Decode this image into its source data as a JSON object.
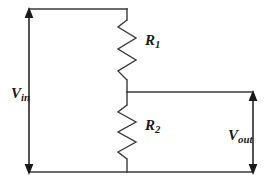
{
  "diagram": {
    "type": "schematic",
    "stroke_color": "#3a3a3a",
    "arrow_color": "#1a1a1a",
    "background_color": "#ffffff",
    "labels": {
      "vin": {
        "symbol": "V",
        "subscript": "in"
      },
      "vout": {
        "symbol": "V",
        "subscript": "out"
      },
      "r1": {
        "symbol": "R",
        "subscript": "1"
      },
      "r2": {
        "symbol": "R",
        "subscript": "2"
      }
    },
    "components": [
      {
        "name": "resistor-r1",
        "label": "R1"
      },
      {
        "name": "resistor-r2",
        "label": "R2"
      },
      {
        "name": "input-voltage-arrow",
        "label": "Vin"
      },
      {
        "name": "output-voltage-arrow",
        "label": "Vout"
      }
    ]
  }
}
